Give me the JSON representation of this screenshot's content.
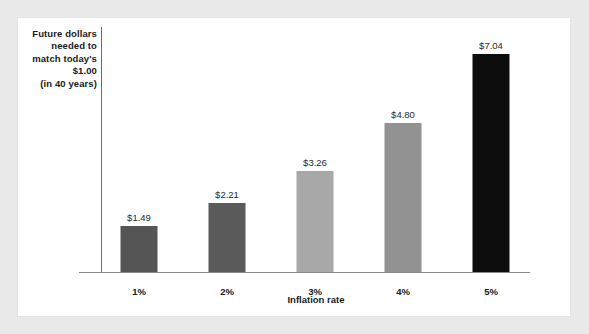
{
  "chart_data": {
    "type": "bar",
    "title": "",
    "subtitle": "",
    "xlabel": "Inflation rate",
    "ylabel": "Future dollars needed to match today's $1.00 (in 40 years)",
    "ylabel_lines": [
      "Future dollars",
      "needed to",
      "match today's",
      "$1.00",
      "(in 40 years)"
    ],
    "categories": [
      "1%",
      "2%",
      "3%",
      "4%",
      "5%"
    ],
    "values": [
      1.49,
      2.21,
      3.26,
      4.8,
      7.04
    ],
    "value_labels": [
      "$1.49",
      "$2.21",
      "$3.26",
      "$4.80",
      "$7.04"
    ],
    "bar_colors": [
      "#555555",
      "#5a5a5a",
      "#a8a8a8",
      "#929292",
      "#0d0d0d"
    ],
    "ylim": [
      0,
      7.9
    ],
    "grid": false,
    "legend": "none",
    "axis_color": "#6b6b6b",
    "panel_color": "#ffffff",
    "background_color": "#e9e9e9"
  }
}
